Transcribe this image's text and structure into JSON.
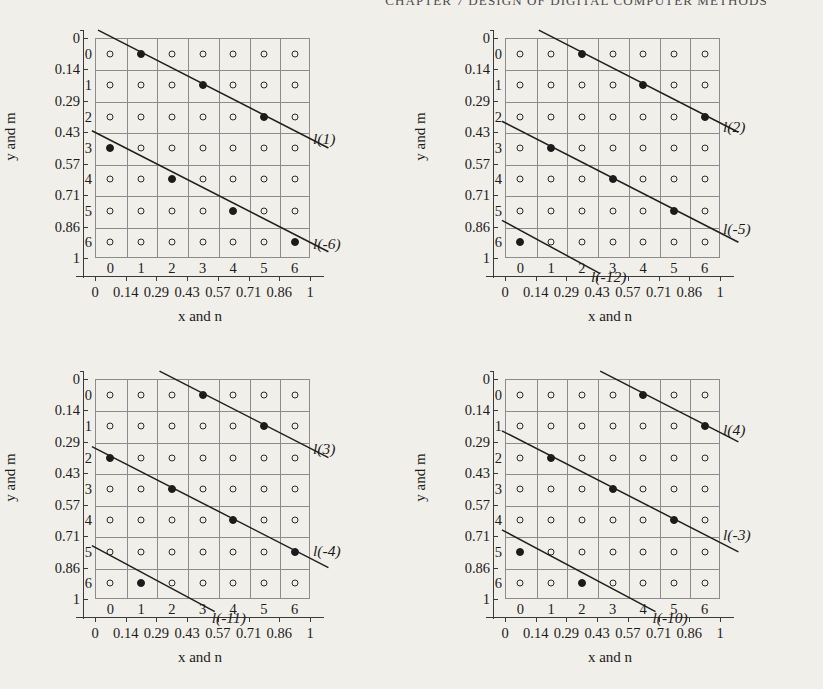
{
  "running_head": "CHAPTER 7  DESIGN OF DIGITAL COMPUTER METHODS",
  "axes": {
    "x_title": "x and n",
    "y_title": "y and m",
    "x_ticks": [
      "0",
      "0.14",
      "0.29",
      "0.43",
      "0.57",
      "0.71",
      "0.86",
      "1"
    ],
    "y_ticks": [
      "0",
      "0.14",
      "0.29",
      "0.43",
      "0.57",
      "0.71",
      "0.86",
      "1"
    ],
    "n_labels": [
      "0",
      "1",
      "2",
      "3",
      "4",
      "5",
      "6"
    ],
    "m_labels": [
      "0",
      "1",
      "2",
      "3",
      "4",
      "5",
      "6"
    ]
  },
  "colors": {
    "page_background": "#f1efe9",
    "grid": "#8c8c8c",
    "axis": "#3a3a3a",
    "node_stroke": "#2b2b2b",
    "node_fill": "#1b1b1b",
    "line": "#1f1f1f"
  },
  "chart_data": {
    "type": "scatter",
    "xlabel": "x and n",
    "ylabel": "y and m",
    "xlim": [
      0,
      1
    ],
    "ylim": [
      0,
      1
    ],
    "x_tick_values": [
      0,
      0.14,
      0.29,
      0.43,
      0.57,
      0.71,
      0.86,
      1
    ],
    "y_tick_values": [
      0,
      0.14,
      0.29,
      0.43,
      0.57,
      0.71,
      0.86,
      1
    ],
    "grid": true,
    "legend": "none",
    "note": "y axis increases downward; integer indices n (columns 0-6) and m (rows 0-6) label lattice cells",
    "panels": [
      {
        "id": "panel-1",
        "position": "top-left",
        "lattice_open_nodes": 49,
        "lines": [
          {
            "label": "l(1)",
            "label_anchor": {
              "n": 6.6,
              "m": 2.75
            },
            "endpoints": {
              "from": {
                "n": -0.4,
                "m": -0.75
              },
              "to": {
                "n": 7.1,
                "m": 3.0
              }
            },
            "selected_nodes": [
              {
                "n": 1,
                "m": 0
              },
              {
                "n": 3,
                "m": 1
              },
              {
                "n": 5,
                "m": 2
              }
            ]
          },
          {
            "label": "l(-6)",
            "label_anchor": {
              "n": 6.6,
              "m": 6.1
            },
            "endpoints": {
              "from": {
                "n": -0.6,
                "m": 2.45
              },
              "to": {
                "n": 7.1,
                "m": 6.3
              }
            },
            "selected_nodes": [
              {
                "n": 0,
                "m": 3
              },
              {
                "n": 2,
                "m": 4
              },
              {
                "n": 4,
                "m": 5
              },
              {
                "n": 6,
                "m": 6
              }
            ]
          }
        ]
      },
      {
        "id": "panel-2",
        "position": "top-right",
        "lattice_open_nodes": 49,
        "lines": [
          {
            "label": "l(2)",
            "label_anchor": {
              "n": 6.6,
              "m": 2.35
            },
            "endpoints": {
              "from": {
                "n": 0.6,
                "m": -0.75
              },
              "to": {
                "n": 7.1,
                "m": 2.5
              }
            },
            "selected_nodes": [
              {
                "n": 2,
                "m": 0
              },
              {
                "n": 4,
                "m": 1
              },
              {
                "n": 6,
                "m": 2
              }
            ]
          },
          {
            "label": "l(-5)",
            "label_anchor": {
              "n": 6.6,
              "m": 5.6
            },
            "endpoints": {
              "from": {
                "n": -0.6,
                "m": 2.15
              },
              "to": {
                "n": 7.1,
                "m": 6.0
              }
            },
            "selected_nodes": [
              {
                "n": 1,
                "m": 3
              },
              {
                "n": 3,
                "m": 4
              },
              {
                "n": 5,
                "m": 5
              }
            ]
          },
          {
            "label": "l(-12)",
            "label_anchor": {
              "n": 2.3,
              "m": 7.15
            },
            "endpoints": {
              "from": {
                "n": -0.6,
                "m": 5.3
              },
              "to": {
                "n": 2.6,
                "m": 7.0
              }
            },
            "selected_nodes": [
              {
                "n": 0,
                "m": 6
              }
            ]
          }
        ]
      },
      {
        "id": "panel-3",
        "position": "bottom-left",
        "lattice_open_nodes": 49,
        "lines": [
          {
            "label": "l(3)",
            "label_anchor": {
              "n": 6.6,
              "m": 1.75
            },
            "endpoints": {
              "from": {
                "n": 1.6,
                "m": -0.75
              },
              "to": {
                "n": 7.1,
                "m": 2.0
              }
            },
            "selected_nodes": [
              {
                "n": 3,
                "m": 0
              },
              {
                "n": 5,
                "m": 1
              }
            ]
          },
          {
            "label": "l(-4)",
            "label_anchor": {
              "n": 6.6,
              "m": 5.0
            },
            "endpoints": {
              "from": {
                "n": -0.6,
                "m": 1.65
              },
              "to": {
                "n": 7.1,
                "m": 5.5
              }
            },
            "selected_nodes": [
              {
                "n": 0,
                "m": 2
              },
              {
                "n": 2,
                "m": 3
              },
              {
                "n": 4,
                "m": 4
              },
              {
                "n": 6,
                "m": 5
              }
            ]
          },
          {
            "label": "l(-11)",
            "label_anchor": {
              "n": 3.3,
              "m": 7.15
            },
            "endpoints": {
              "from": {
                "n": -0.6,
                "m": 4.8
              },
              "to": {
                "n": 3.4,
                "m": 6.9
              }
            },
            "selected_nodes": [
              {
                "n": 1,
                "m": 6
              }
            ]
          }
        ]
      },
      {
        "id": "panel-4",
        "position": "bottom-right",
        "lattice_open_nodes": 49,
        "lines": [
          {
            "label": "l(4)",
            "label_anchor": {
              "n": 6.6,
              "m": 1.15
            },
            "endpoints": {
              "from": {
                "n": 2.6,
                "m": -0.75
              },
              "to": {
                "n": 7.1,
                "m": 1.5
              }
            },
            "selected_nodes": [
              {
                "n": 4,
                "m": 0
              },
              {
                "n": 6,
                "m": 1
              }
            ]
          },
          {
            "label": "l(-3)",
            "label_anchor": {
              "n": 6.6,
              "m": 4.5
            },
            "endpoints": {
              "from": {
                "n": -0.6,
                "m": 1.15
              },
              "to": {
                "n": 7.1,
                "m": 5.0
              }
            },
            "selected_nodes": [
              {
                "n": 1,
                "m": 2
              },
              {
                "n": 3,
                "m": 3
              },
              {
                "n": 5,
                "m": 4
              }
            ]
          },
          {
            "label": "l(-10)",
            "label_anchor": {
              "n": 4.3,
              "m": 7.15
            },
            "endpoints": {
              "from": {
                "n": -0.6,
                "m": 4.3
              },
              "to": {
                "n": 4.4,
                "m": 6.9
              }
            },
            "selected_nodes": [
              {
                "n": 0,
                "m": 5
              },
              {
                "n": 2,
                "m": 6
              }
            ]
          }
        ]
      }
    ]
  }
}
